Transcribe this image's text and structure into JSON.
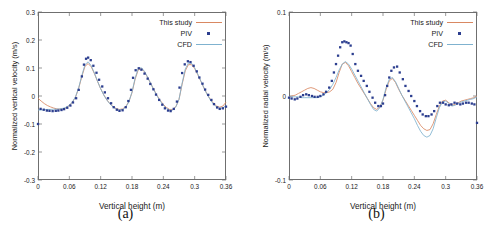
{
  "figure": {
    "colors": {
      "this_study": "#d98862",
      "piv": "#2c3e8f",
      "cfd": "#7fb2cf",
      "axis": "#6f6f6f",
      "text": "#1a1a1a",
      "background": "#ffffff"
    },
    "legend": {
      "items": [
        {
          "label": "This study",
          "key": "line",
          "color_ref": "this_study"
        },
        {
          "label": "PIV",
          "key": "marker",
          "color_ref": "piv"
        },
        {
          "label": "CFD",
          "key": "line",
          "color_ref": "cfd"
        }
      ]
    },
    "panels": [
      {
        "caption": "(a)"
      },
      {
        "caption": "(b)"
      }
    ]
  },
  "chart_data": [
    {
      "type": "line",
      "panel": "a",
      "title": "",
      "xlabel": "Vertical height (m)",
      "ylabel": "Normalized vertical velocity (m/s)",
      "xlim": [
        0,
        0.36
      ],
      "ylim": [
        -0.3,
        0.3
      ],
      "xticks": [
        0,
        0.06,
        0.12,
        0.18,
        0.24,
        0.3,
        0.36
      ],
      "xticklabels": [
        "0",
        "0.06",
        "0.12",
        "0.18",
        "0.24",
        "0.3",
        "0.36"
      ],
      "yticks": [
        -0.3,
        -0.2,
        -0.1,
        0,
        0.1,
        0.2,
        0.3
      ],
      "yticklabels": [
        "-0.3",
        "-0.2",
        "-0.1",
        "0",
        "0.1",
        "0.2",
        "0.3"
      ],
      "grid": false,
      "legend_position": "top-right",
      "series": [
        {
          "name": "This study",
          "style": "line",
          "color": "#d98862",
          "x": [
            0.0,
            0.006,
            0.012,
            0.018,
            0.024,
            0.03,
            0.036,
            0.042,
            0.048,
            0.054,
            0.06,
            0.066,
            0.072,
            0.078,
            0.084,
            0.09,
            0.096,
            0.102,
            0.108,
            0.114,
            0.12,
            0.126,
            0.132,
            0.138,
            0.144,
            0.15,
            0.156,
            0.162,
            0.168,
            0.174,
            0.18,
            0.186,
            0.192,
            0.198,
            0.204,
            0.21,
            0.216,
            0.222,
            0.228,
            0.234,
            0.24,
            0.246,
            0.252,
            0.258,
            0.264,
            0.27,
            0.276,
            0.282,
            0.288,
            0.294,
            0.3,
            0.306,
            0.312,
            0.318,
            0.324,
            0.33,
            0.336,
            0.342,
            0.348,
            0.354,
            0.36
          ],
          "y": [
            -0.008,
            -0.018,
            -0.027,
            -0.034,
            -0.039,
            -0.043,
            -0.046,
            -0.047,
            -0.046,
            -0.042,
            -0.034,
            -0.022,
            -0.003,
            0.028,
            0.07,
            0.106,
            0.116,
            0.104,
            0.08,
            0.052,
            0.026,
            0.004,
            -0.014,
            -0.028,
            -0.038,
            -0.045,
            -0.048,
            -0.046,
            -0.038,
            -0.02,
            0.012,
            0.06,
            0.094,
            0.098,
            0.086,
            0.066,
            0.044,
            0.022,
            0.002,
            -0.016,
            -0.03,
            -0.041,
            -0.048,
            -0.048,
            -0.038,
            -0.012,
            0.042,
            0.09,
            0.112,
            0.112,
            0.098,
            0.076,
            0.052,
            0.028,
            0.006,
            -0.012,
            -0.026,
            -0.036,
            -0.04,
            -0.036,
            -0.022
          ]
        },
        {
          "name": "CFD",
          "style": "line",
          "color": "#7fb2cf",
          "x": [
            0.0,
            0.006,
            0.012,
            0.018,
            0.024,
            0.03,
            0.036,
            0.042,
            0.048,
            0.054,
            0.06,
            0.066,
            0.072,
            0.078,
            0.084,
            0.09,
            0.096,
            0.102,
            0.108,
            0.114,
            0.12,
            0.126,
            0.132,
            0.138,
            0.144,
            0.15,
            0.156,
            0.162,
            0.168,
            0.174,
            0.18,
            0.186,
            0.192,
            0.198,
            0.204,
            0.21,
            0.216,
            0.222,
            0.228,
            0.234,
            0.24,
            0.246,
            0.252,
            0.258,
            0.264,
            0.27,
            0.276,
            0.282,
            0.288,
            0.294,
            0.3,
            0.306,
            0.312,
            0.318,
            0.324,
            0.33,
            0.336,
            0.342,
            0.348,
            0.354,
            0.36
          ],
          "y": [
            -0.05,
            -0.05,
            -0.049,
            -0.048,
            -0.048,
            -0.047,
            -0.047,
            -0.046,
            -0.044,
            -0.04,
            -0.033,
            -0.021,
            -0.002,
            0.03,
            0.074,
            0.112,
            0.122,
            0.108,
            0.082,
            0.053,
            0.026,
            0.003,
            -0.015,
            -0.029,
            -0.04,
            -0.047,
            -0.05,
            -0.048,
            -0.04,
            -0.021,
            0.014,
            0.064,
            0.098,
            0.101,
            0.088,
            0.067,
            0.044,
            0.021,
            0.0,
            -0.018,
            -0.033,
            -0.044,
            -0.051,
            -0.05,
            -0.039,
            -0.012,
            0.046,
            0.096,
            0.118,
            0.117,
            0.101,
            0.078,
            0.053,
            0.028,
            0.005,
            -0.014,
            -0.029,
            -0.039,
            -0.044,
            -0.042,
            -0.035
          ]
        },
        {
          "name": "PIV",
          "style": "markers",
          "color": "#2c3e8f",
          "x": [
            0.0,
            0.005,
            0.011,
            0.017,
            0.022,
            0.028,
            0.034,
            0.039,
            0.045,
            0.05,
            0.056,
            0.062,
            0.067,
            0.073,
            0.078,
            0.084,
            0.088,
            0.092,
            0.096,
            0.101,
            0.106,
            0.112,
            0.117,
            0.123,
            0.128,
            0.134,
            0.14,
            0.145,
            0.151,
            0.156,
            0.162,
            0.168,
            0.173,
            0.178,
            0.182,
            0.187,
            0.193,
            0.198,
            0.204,
            0.21,
            0.215,
            0.221,
            0.226,
            0.232,
            0.238,
            0.243,
            0.249,
            0.254,
            0.26,
            0.266,
            0.271,
            0.276,
            0.281,
            0.287,
            0.292,
            0.298,
            0.304,
            0.309,
            0.315,
            0.32,
            0.326,
            0.332,
            0.337,
            0.343,
            0.348,
            0.354,
            0.36
          ],
          "y": [
            -0.1,
            -0.046,
            -0.049,
            -0.052,
            -0.053,
            -0.054,
            -0.053,
            -0.052,
            -0.05,
            -0.047,
            -0.042,
            -0.034,
            -0.023,
            -0.008,
            0.022,
            0.07,
            0.112,
            0.133,
            0.137,
            0.128,
            0.108,
            0.083,
            0.058,
            0.034,
            0.013,
            -0.008,
            -0.026,
            -0.04,
            -0.049,
            -0.053,
            -0.051,
            -0.04,
            -0.018,
            0.022,
            0.065,
            0.092,
            0.099,
            0.094,
            0.08,
            0.062,
            0.043,
            0.024,
            0.005,
            -0.014,
            -0.031,
            -0.044,
            -0.052,
            -0.054,
            -0.046,
            -0.02,
            0.03,
            0.082,
            0.113,
            0.124,
            0.121,
            0.108,
            0.088,
            0.066,
            0.044,
            0.023,
            0.004,
            -0.014,
            -0.029,
            -0.041,
            -0.046,
            -0.044,
            -0.038
          ]
        }
      ]
    },
    {
      "type": "line",
      "panel": "b",
      "title": "",
      "xlabel": "Vertical height (m)",
      "ylabel": "Normalized radial velocity (m/s)",
      "xlim": [
        0,
        0.36
      ],
      "ylim": [
        -0.1,
        0.1
      ],
      "xticks": [
        0,
        0.06,
        0.12,
        0.18,
        0.24,
        0.3,
        0.36
      ],
      "xticklabels": [
        "0",
        "0.06",
        "0.12",
        "0.18",
        "0.24",
        "0.3",
        "0.36"
      ],
      "yticks": [
        -0.1,
        0,
        0.1
      ],
      "yticklabels": [
        "-0.1",
        "0",
        "0.1"
      ],
      "grid": false,
      "legend_position": "top-right",
      "series": [
        {
          "name": "This study",
          "style": "line",
          "color": "#d98862",
          "x": [
            0.0,
            0.006,
            0.012,
            0.018,
            0.024,
            0.03,
            0.036,
            0.042,
            0.048,
            0.054,
            0.06,
            0.066,
            0.072,
            0.078,
            0.084,
            0.09,
            0.096,
            0.102,
            0.108,
            0.114,
            0.12,
            0.126,
            0.132,
            0.138,
            0.144,
            0.15,
            0.156,
            0.162,
            0.168,
            0.174,
            0.18,
            0.186,
            0.192,
            0.198,
            0.204,
            0.21,
            0.216,
            0.222,
            0.228,
            0.234,
            0.24,
            0.246,
            0.252,
            0.258,
            0.264,
            0.27,
            0.276,
            0.282,
            0.288,
            0.294,
            0.3,
            0.306,
            0.312,
            0.318,
            0.324,
            0.33,
            0.336,
            0.342,
            0.348,
            0.354,
            0.36
          ],
          "y": [
            -0.001,
            0.0,
            0.001,
            0.003,
            0.005,
            0.007,
            0.009,
            0.01,
            0.009,
            0.007,
            0.005,
            0.004,
            0.004,
            0.005,
            0.008,
            0.016,
            0.028,
            0.038,
            0.04,
            0.036,
            0.029,
            0.022,
            0.015,
            0.009,
            0.003,
            -0.003,
            -0.009,
            -0.014,
            -0.016,
            -0.013,
            -0.005,
            0.008,
            0.018,
            0.021,
            0.016,
            0.008,
            0.001,
            -0.005,
            -0.011,
            -0.017,
            -0.023,
            -0.029,
            -0.035,
            -0.039,
            -0.041,
            -0.04,
            -0.033,
            -0.022,
            -0.012,
            -0.006,
            -0.005,
            -0.008,
            -0.011,
            -0.01,
            -0.008,
            -0.006,
            -0.005,
            -0.004,
            -0.003,
            -0.002,
            0.0
          ]
        },
        {
          "name": "CFD",
          "style": "line",
          "color": "#7fb2cf",
          "x": [
            0.0,
            0.006,
            0.012,
            0.018,
            0.024,
            0.03,
            0.036,
            0.042,
            0.048,
            0.054,
            0.06,
            0.066,
            0.072,
            0.078,
            0.084,
            0.09,
            0.096,
            0.102,
            0.108,
            0.114,
            0.12,
            0.126,
            0.132,
            0.138,
            0.144,
            0.15,
            0.156,
            0.162,
            0.168,
            0.174,
            0.18,
            0.186,
            0.192,
            0.198,
            0.204,
            0.21,
            0.216,
            0.222,
            0.228,
            0.234,
            0.24,
            0.246,
            0.252,
            0.258,
            0.264,
            0.27,
            0.276,
            0.282,
            0.288,
            0.294,
            0.3,
            0.306,
            0.312,
            0.318,
            0.324,
            0.33,
            0.336,
            0.342,
            0.348,
            0.354,
            0.36
          ],
          "y": [
            -0.001,
            -0.001,
            -0.001,
            -0.001,
            -0.002,
            -0.002,
            -0.002,
            -0.002,
            -0.002,
            -0.002,
            -0.001,
            0.001,
            0.004,
            0.008,
            0.014,
            0.022,
            0.031,
            0.038,
            0.041,
            0.038,
            0.032,
            0.025,
            0.018,
            0.011,
            0.004,
            -0.003,
            -0.01,
            -0.016,
            -0.018,
            -0.014,
            -0.004,
            0.01,
            0.02,
            0.022,
            0.017,
            0.009,
            0.001,
            -0.006,
            -0.013,
            -0.02,
            -0.027,
            -0.035,
            -0.042,
            -0.047,
            -0.049,
            -0.047,
            -0.039,
            -0.026,
            -0.014,
            -0.007,
            -0.006,
            -0.009,
            -0.012,
            -0.011,
            -0.009,
            -0.007,
            -0.006,
            -0.005,
            -0.004,
            -0.003,
            -0.001
          ]
        },
        {
          "name": "PIV",
          "style": "markers",
          "color": "#2c3e8f",
          "x": [
            0.0,
            0.005,
            0.011,
            0.016,
            0.022,
            0.027,
            0.033,
            0.038,
            0.044,
            0.049,
            0.055,
            0.06,
            0.066,
            0.071,
            0.077,
            0.082,
            0.086,
            0.09,
            0.094,
            0.098,
            0.102,
            0.106,
            0.11,
            0.114,
            0.118,
            0.122,
            0.127,
            0.132,
            0.138,
            0.143,
            0.149,
            0.154,
            0.16,
            0.165,
            0.171,
            0.176,
            0.18,
            0.184,
            0.188,
            0.192,
            0.196,
            0.201,
            0.207,
            0.212,
            0.218,
            0.223,
            0.229,
            0.234,
            0.24,
            0.245,
            0.251,
            0.256,
            0.262,
            0.267,
            0.273,
            0.278,
            0.284,
            0.289,
            0.295,
            0.3,
            0.306,
            0.311,
            0.317,
            0.322,
            0.328,
            0.333,
            0.339,
            0.344,
            0.35,
            0.355,
            0.36
          ],
          "y": [
            -0.002,
            -0.003,
            -0.004,
            -0.003,
            -0.001,
            0.001,
            0.002,
            0.001,
            0.0,
            -0.001,
            -0.001,
            0.0,
            0.002,
            0.005,
            0.01,
            0.018,
            0.028,
            0.038,
            0.048,
            0.058,
            0.064,
            0.065,
            0.064,
            0.063,
            0.06,
            0.05,
            0.038,
            0.03,
            0.024,
            0.018,
            0.012,
            0.005,
            -0.002,
            -0.008,
            -0.012,
            -0.012,
            -0.009,
            0.001,
            0.012,
            0.022,
            0.03,
            0.034,
            0.035,
            0.028,
            0.02,
            0.012,
            0.006,
            0.0,
            -0.006,
            -0.012,
            -0.018,
            -0.022,
            -0.024,
            -0.024,
            -0.022,
            -0.018,
            -0.012,
            -0.008,
            -0.008,
            -0.01,
            -0.011,
            -0.01,
            -0.008,
            -0.009,
            -0.01,
            -0.009,
            -0.008,
            -0.008,
            -0.009,
            -0.01,
            -0.032
          ]
        }
      ]
    }
  ]
}
